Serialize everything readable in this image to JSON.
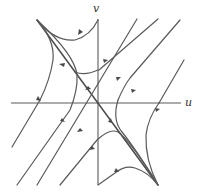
{
  "figure": {
    "type": "phase_portrait",
    "axes": {
      "x_label": "u",
      "y_label": "v"
    },
    "colors": {
      "line": "#5a5a5a",
      "background": "#ffffff"
    }
  }
}
